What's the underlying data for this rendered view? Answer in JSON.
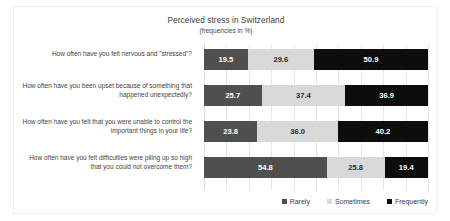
{
  "chart_data": {
    "type": "bar",
    "orientation": "horizontal",
    "stacked": true,
    "stacked_percent": true,
    "title": "Perceived stress in Switzerland",
    "subtitle": "(frequencies in %)",
    "xlabel": "",
    "ylabel": "",
    "xlim": [
      0,
      100
    ],
    "grid": true,
    "legend_position": "bottom-right",
    "categories": [
      "How often have you felt nervous and \"stressed\"?",
      "How often have you been upset because of something that happened unexpectedly?",
      "How often have you felt that you were unable to control the important things in your life?",
      "How often have you felt difficulties were piling up so high that you could not overcome them?"
    ],
    "series": [
      {
        "name": "Rarely",
        "color": "#4f4f4f",
        "values": [
          19.5,
          25.7,
          23.8,
          54.8
        ],
        "labels": [
          "19.5",
          "25.7",
          "23.8",
          "54.8"
        ]
      },
      {
        "name": "Sometimes",
        "color": "#d8d8d8",
        "values": [
          29.6,
          37.4,
          36.0,
          25.8
        ],
        "labels": [
          "29.6",
          "37.4",
          "36.0",
          "25.8"
        ]
      },
      {
        "name": "Frequently",
        "color": "#0d0d0d",
        "values": [
          50.9,
          36.9,
          40.2,
          19.4
        ],
        "labels": [
          "50.9",
          "36.9",
          "40.2",
          "19.4"
        ]
      }
    ],
    "legend": [
      "Rarely",
      "Sometimes",
      "Frequently"
    ]
  }
}
